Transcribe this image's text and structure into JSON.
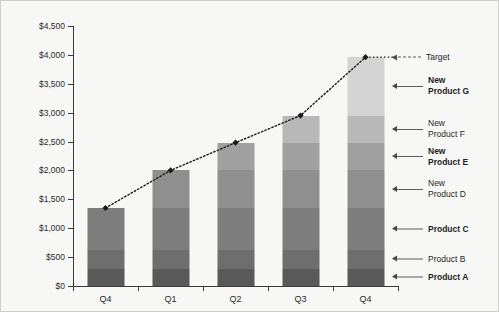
{
  "chart_data": {
    "type": "bar",
    "stacked": true,
    "title": "",
    "subtitle": "",
    "xlabel": "",
    "ylabel": "",
    "categories": [
      "Q4",
      "Q1",
      "Q2",
      "Q3",
      "Q4"
    ],
    "ylim": [
      0,
      4500
    ],
    "ytick_values": [
      0,
      500,
      1000,
      1500,
      2000,
      2500,
      3000,
      3500,
      4000,
      4500
    ],
    "ytick_labels": [
      "$0",
      "$500",
      "$1,000",
      "$1,500",
      "$2,000",
      "$2,500",
      "$3,000",
      "$3,500",
      "$4,000",
      "$4,500"
    ],
    "grid": false,
    "legend_position": "right-annotations",
    "series": [
      {
        "name": "Product A",
        "bold": true,
        "color": "#595959",
        "values": [
          300,
          300,
          300,
          300,
          300
        ]
      },
      {
        "name": "Product B",
        "bold": false,
        "color": "#6e6e6e",
        "values": [
          330,
          330,
          330,
          330,
          330
        ]
      },
      {
        "name": "Product C",
        "bold": true,
        "color": "#7d7d7d",
        "values": [
          720,
          720,
          720,
          720,
          720
        ]
      },
      {
        "name": "New\nProduct D",
        "bold": false,
        "color": "#8f8f8f",
        "values": [
          0,
          650,
          650,
          650,
          650
        ]
      },
      {
        "name": "New\nProduct E",
        "bold": true,
        "color": "#a0a0a0",
        "values": [
          0,
          0,
          480,
          480,
          480
        ]
      },
      {
        "name": "New\nProduct F",
        "bold": false,
        "color": "#b8b8b8",
        "values": [
          0,
          0,
          0,
          470,
          470
        ]
      },
      {
        "name": "New\nProduct G",
        "bold": true,
        "color": "#d4d4d4",
        "values": [
          0,
          0,
          0,
          0,
          1010
        ]
      }
    ],
    "totals": [
      1350,
      2000,
      2480,
      2950,
      3960
    ],
    "target_line": {
      "name": "Target",
      "style": "dotted",
      "marker": "diamond",
      "color": "#1a1a1a",
      "values": [
        1350,
        2000,
        2480,
        2950,
        3960
      ]
    }
  },
  "annotations": [
    {
      "label": "Target",
      "bold": false,
      "style": "dotted",
      "value": 3960
    },
    {
      "label": "New\nProduct G",
      "bold": true,
      "style": "solid",
      "value": 3455
    },
    {
      "label": "New\nProduct F",
      "bold": false,
      "style": "solid",
      "value": 2715
    },
    {
      "label": "New\nProduct E",
      "bold": true,
      "style": "solid",
      "value": 2240
    },
    {
      "label": "New\nProduct D",
      "bold": false,
      "style": "solid",
      "value": 1675
    },
    {
      "label": "Product C",
      "bold": true,
      "style": "solid",
      "value": 990
    },
    {
      "label": "Product B",
      "bold": false,
      "style": "solid",
      "value": 465
    },
    {
      "label": "Product A",
      "bold": true,
      "style": "solid",
      "value": 150
    }
  ]
}
